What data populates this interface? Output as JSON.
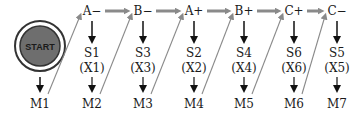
{
  "diagram": {
    "start_label": "START",
    "colors": {
      "start_fill": "#6e6e6e",
      "start_ring": "#333333",
      "gray_arrow": "#8a8a8a",
      "black_arrow": "#111111",
      "text": "#1a1a1a"
    },
    "first_memory": "M1",
    "steps": [
      {
        "action": "A−",
        "state": "S1",
        "output": "(X1)",
        "memory": "M2"
      },
      {
        "action": "B−",
        "state": "S3",
        "output": "(X3)",
        "memory": "M3"
      },
      {
        "action": "A+",
        "state": "S2",
        "output": "(X2)",
        "memory": "M4"
      },
      {
        "action": "B+",
        "state": "S4",
        "output": "(X4)",
        "memory": "M5"
      },
      {
        "action": "C+",
        "state": "S6",
        "output": "(X6)",
        "memory": "M6"
      },
      {
        "action": "C−",
        "state": "S5",
        "output": "(X5)",
        "memory": "M7"
      }
    ]
  }
}
